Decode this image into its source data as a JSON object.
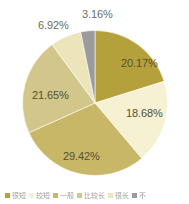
{
  "chart_data": {
    "type": "pie",
    "title": "",
    "subtitle": "",
    "xlabel": "",
    "ylabel": "",
    "legend_position": "bottom",
    "grid": false,
    "labels_show_percent": true,
    "categories": [
      "很短",
      "较短",
      "一般",
      "比较长",
      "很长",
      "不清楚"
    ],
    "values": [
      20.17,
      18.68,
      29.42,
      21.65,
      6.92,
      3.16
    ],
    "value_labels": [
      "20.17%",
      "18.68%",
      "29.42%",
      "21.65%",
      "6.92%",
      "3.16%"
    ],
    "colors": [
      "#b5a13c",
      "#f6f1d2",
      "#c7b767",
      "#d2c68a",
      "#ece5bb",
      "#9b9b9b"
    ],
    "start_angle_deg": 0,
    "direction": "clockwise"
  },
  "legend": {
    "items": [
      {
        "label": "很短",
        "color": "#b5a13c"
      },
      {
        "label": "较短",
        "color": "#f6f1d2"
      },
      {
        "label": "一般",
        "color": "#c7b767"
      },
      {
        "label": "比较长",
        "color": "#d2c68a"
      },
      {
        "label": "很长",
        "color": "#ece5bb"
      },
      {
        "label": "不",
        "color": "#9b9b9b"
      }
    ]
  },
  "labels": {
    "slice_0": "20.17%",
    "slice_1": "18.68%",
    "slice_2": "29.42%",
    "slice_3": "21.65%",
    "slice_4": "6.92%",
    "slice_5": "3.16%"
  }
}
